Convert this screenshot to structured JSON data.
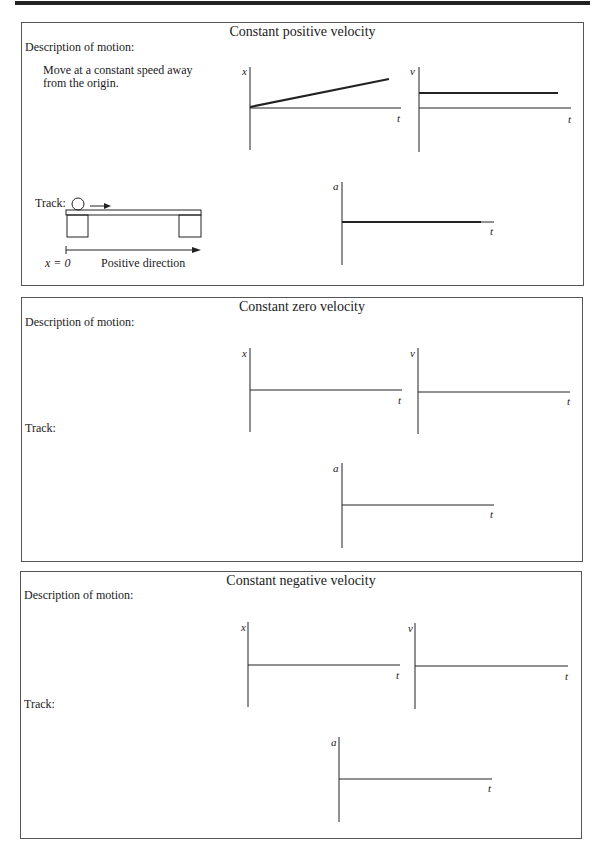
{
  "panels": [
    {
      "title": "Constant positive velocity",
      "description_label": "Description of motion:",
      "description_text": "Move at a constant speed away from the origin.",
      "track_label": "Track:",
      "track": {
        "origin_label": "x = 0",
        "direction_label": "Positive direction"
      },
      "graphs": {
        "x_label": "x",
        "v_label": "v",
        "a_label": "a",
        "t_label": "t"
      }
    },
    {
      "title": "Constant zero velocity",
      "description_label": "Description of motion:",
      "description_text": "",
      "track_label": "Track:",
      "graphs": {
        "x_label": "x",
        "v_label": "v",
        "a_label": "a",
        "t_label": "t"
      }
    },
    {
      "title": "Constant negative velocity",
      "description_label": "Description of motion:",
      "description_text": "",
      "track_label": "Track:",
      "graphs": {
        "x_label": "x",
        "v_label": "v",
        "a_label": "a",
        "t_label": "t"
      }
    }
  ],
  "colors": {
    "ink": "#1a1a1a",
    "border": "#555555",
    "background": "#ffffff"
  }
}
